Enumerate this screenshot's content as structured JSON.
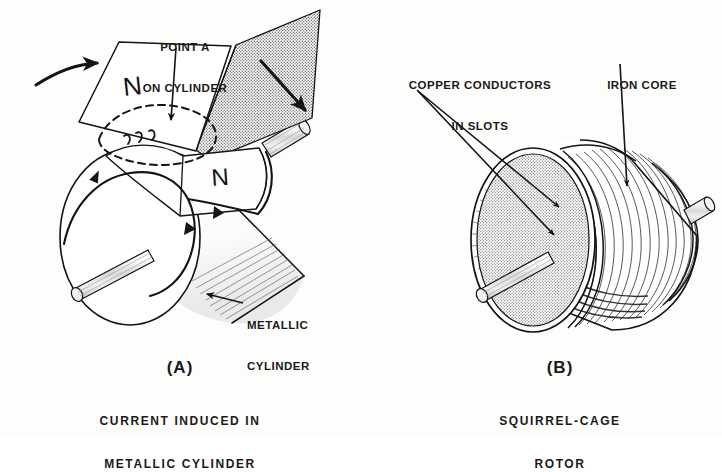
{
  "figure": {
    "background_color": "#fdfdfc",
    "ink_color": "#1a1a1a",
    "stipple_color": "#8a8a8a"
  },
  "panel_a": {
    "letter": "(A)",
    "caption_line1": "CURRENT INDUCED IN",
    "caption_line2": "METALLIC CYLINDER",
    "callouts": [
      {
        "line1": "POINT A",
        "line2": "ON CYLINDER"
      },
      {
        "line1": "METALLIC",
        "line2": "CYLINDER"
      }
    ],
    "pole_labels": [
      "N",
      "N"
    ]
  },
  "panel_b": {
    "letter": "(B)",
    "caption_line1": "SQUIRREL-CAGE",
    "caption_line2": "ROTOR",
    "callouts": [
      {
        "line1": "COPPER CONDUCTORS",
        "line2": "IN SLOTS"
      },
      {
        "line1": "IRON CORE",
        "line2": ""
      }
    ]
  }
}
